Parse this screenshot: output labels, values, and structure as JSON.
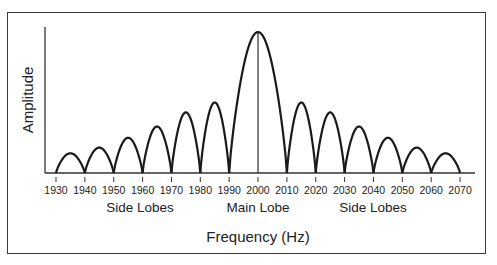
{
  "chart_data": {
    "type": "line",
    "title": "",
    "xlabel": "Frequency (Hz)",
    "ylabel": "Amplitude",
    "x_ticks": [
      1930,
      1940,
      1950,
      1960,
      1970,
      1980,
      1990,
      2000,
      2010,
      2020,
      2030,
      2040,
      2050,
      2060,
      2070
    ],
    "xlim": [
      1930,
      2075
    ],
    "ylim": [
      0,
      105
    ],
    "grid": false,
    "legend": null,
    "lobes": [
      {
        "start": 1930,
        "end": 1940,
        "peak_x": 1935,
        "peak": 14,
        "kind": "side"
      },
      {
        "start": 1940,
        "end": 1950,
        "peak_x": 1945,
        "peak": 18,
        "kind": "side"
      },
      {
        "start": 1950,
        "end": 1960,
        "peak_x": 1955,
        "peak": 25,
        "kind": "side"
      },
      {
        "start": 1960,
        "end": 1970,
        "peak_x": 1965,
        "peak": 33,
        "kind": "side"
      },
      {
        "start": 1970,
        "end": 1980,
        "peak_x": 1975,
        "peak": 43,
        "kind": "side"
      },
      {
        "start": 1980,
        "end": 1990,
        "peak_x": 1985,
        "peak": 50,
        "kind": "side"
      },
      {
        "start": 1990,
        "end": 2010,
        "peak_x": 2000,
        "peak": 100,
        "kind": "main"
      },
      {
        "start": 2010,
        "end": 2020,
        "peak_x": 2015,
        "peak": 50,
        "kind": "side"
      },
      {
        "start": 2020,
        "end": 2030,
        "peak_x": 2025,
        "peak": 43,
        "kind": "side"
      },
      {
        "start": 2030,
        "end": 2040,
        "peak_x": 2035,
        "peak": 33,
        "kind": "side"
      },
      {
        "start": 2040,
        "end": 2050,
        "peak_x": 2045,
        "peak": 25,
        "kind": "side"
      },
      {
        "start": 2050,
        "end": 2060,
        "peak_x": 2055,
        "peak": 18,
        "kind": "side"
      },
      {
        "start": 2060,
        "end": 2070,
        "peak_x": 2065,
        "peak": 14,
        "kind": "side"
      }
    ],
    "center_line_x": 2000,
    "annotations": [
      {
        "text": "Side Lobes",
        "x": 1950
      },
      {
        "text": "Main Lobe",
        "x": 2000
      },
      {
        "text": "Side Lobes",
        "x": 2040
      }
    ]
  },
  "labels": {
    "xlabel": "Frequency (Hz)",
    "ylabel": "Amplitude",
    "left_side": "Side Lobes",
    "main": "Main Lobe",
    "right_side": "Side Lobes"
  },
  "colors": {
    "line": "#1a1a1a",
    "axis": "#333333",
    "frame": "#3a3a3a",
    "text": "#222222"
  }
}
